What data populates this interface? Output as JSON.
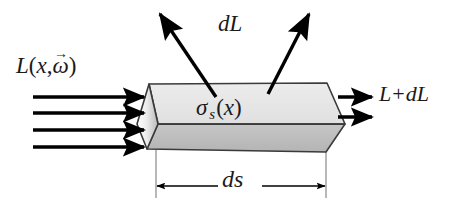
{
  "figure": {
    "background_color": "#ffffff",
    "stroke_color": "#000000",
    "guide_color": "#9a9a9a",
    "top_face_color": "#e8e8e8",
    "front_face_color": "#bdbdbd",
    "end_face_color": "#d6d6d6"
  },
  "labels": {
    "incoming_radiance": {
      "L": "L",
      "open_paren": "(",
      "x": "x",
      "comma": ",",
      "omega": "ω",
      "omega_arrow": "→",
      "close_paren": ")"
    },
    "scattering_coefficient": {
      "sigma": "σ",
      "subscript": "s",
      "open_paren": "(",
      "x": "x",
      "close_paren": ")"
    },
    "scattered_radiance": "dL",
    "outgoing_radiance": {
      "L": "L",
      "plus": "+",
      "dL": "dL"
    },
    "segment_length": "ds"
  },
  "arrows": {
    "incoming_count": 4,
    "outgoing_count": 2,
    "scattered_count": 2
  }
}
